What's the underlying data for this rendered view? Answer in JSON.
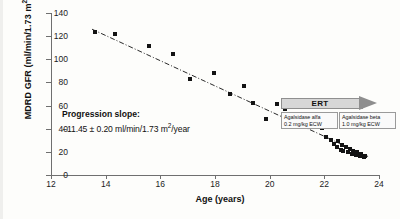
{
  "chart_data": {
    "type": "scatter",
    "title": "",
    "xlabel": "Age (years)",
    "ylabel": "MDRD GFR (ml/min/1.73 m2)",
    "ylabel_parts": {
      "main": "MDRD GFR (ml/min/1.73 m",
      "sup": "2",
      "tail": ")"
    },
    "xlim": [
      12,
      24
    ],
    "ylim": [
      0,
      140
    ],
    "xticks": [
      12,
      14,
      16,
      18,
      20,
      22,
      24
    ],
    "yticks": [
      0,
      20,
      40,
      60,
      80,
      100,
      120,
      140
    ],
    "grid": false,
    "legend": "none",
    "marker": "filled-square",
    "marker_color": "#131313",
    "trend": {
      "style": "dash-dot",
      "color": "#2b2b2b",
      "x_start": 13.5,
      "y_start": 126,
      "x_end": 23.6,
      "y_end": 16,
      "slope": -11.45
    },
    "points": [
      {
        "x": 13.6,
        "y": 124.0
      },
      {
        "x": 14.35,
        "y": 121.5
      },
      {
        "x": 15.6,
        "y": 111.5
      },
      {
        "x": 16.45,
        "y": 104.5
      },
      {
        "x": 17.1,
        "y": 83.0
      },
      {
        "x": 17.95,
        "y": 88.5
      },
      {
        "x": 18.55,
        "y": 70.0
      },
      {
        "x": 19.05,
        "y": 77.0
      },
      {
        "x": 19.4,
        "y": 62.5
      },
      {
        "x": 19.85,
        "y": 48.5
      },
      {
        "x": 20.25,
        "y": 61.0
      },
      {
        "x": 20.55,
        "y": 57.0
      },
      {
        "x": 20.95,
        "y": 48.0
      },
      {
        "x": 21.35,
        "y": 53.0
      },
      {
        "x": 21.6,
        "y": 45.5
      },
      {
        "x": 21.9,
        "y": 41.0
      },
      {
        "x": 22.05,
        "y": 32.5
      },
      {
        "x": 22.25,
        "y": 30.5
      },
      {
        "x": 22.35,
        "y": 27.0
      },
      {
        "x": 22.45,
        "y": 24.0
      },
      {
        "x": 22.5,
        "y": 29.0
      },
      {
        "x": 22.6,
        "y": 22.0
      },
      {
        "x": 22.65,
        "y": 26.0
      },
      {
        "x": 22.7,
        "y": 20.5
      },
      {
        "x": 22.8,
        "y": 24.5
      },
      {
        "x": 22.85,
        "y": 19.5
      },
      {
        "x": 22.95,
        "y": 22.5
      },
      {
        "x": 23.0,
        "y": 18.5
      },
      {
        "x": 23.05,
        "y": 21.0
      },
      {
        "x": 23.15,
        "y": 17.5
      },
      {
        "x": 23.2,
        "y": 19.5
      },
      {
        "x": 23.3,
        "y": 16.5
      },
      {
        "x": 23.35,
        "y": 18.0
      },
      {
        "x": 23.45,
        "y": 15.5
      },
      {
        "x": 23.5,
        "y": 16.5
      }
    ],
    "annotations": {
      "slope_title": "Progression slope:",
      "slope_value": "−11.45 ± 0.20 ml/min/1.73 m",
      "slope_value_sup": "2",
      "slope_value_tail": "/year",
      "ert_label": "ERT",
      "ert_treatments": [
        {
          "drug": "Agalsidase alfa",
          "dose": "0.2 mg/kg ECW"
        },
        {
          "drug": "Agalsidase beta",
          "dose": "1.0 mg/kg ECW"
        }
      ]
    }
  }
}
